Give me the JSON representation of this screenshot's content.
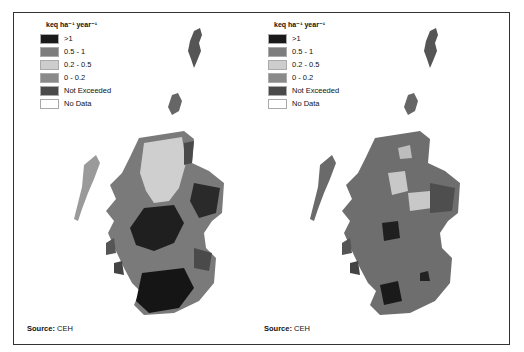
{
  "maps": [
    {
      "id": "left",
      "legend": {
        "title": "keq ha⁻¹ year⁻¹",
        "items": [
          {
            "label": ">1",
            "color": "#1a1a1a"
          },
          {
            "label": "0.5 - 1",
            "color": "#7d7d7d"
          },
          {
            "label": "0.2 - 0.5",
            "color": "#cdcdcd"
          },
          {
            "label": "0 - 0.2",
            "color": "#8a8a8a"
          },
          {
            "label": "Not Exceeded",
            "color": "#4a4a4a"
          },
          {
            "label": "No Data",
            "color": "#ffffff"
          }
        ]
      },
      "source": {
        "label": "Source:",
        "value": " CEH"
      },
      "region": "Scotland"
    },
    {
      "id": "right",
      "legend": {
        "title": "keq ha⁻¹ year⁻¹",
        "items": [
          {
            "label": ">1",
            "color": "#1a1a1a"
          },
          {
            "label": "0.5 - 1",
            "color": "#7d7d7d"
          },
          {
            "label": "0.2 - 0.5",
            "color": "#cdcdcd"
          },
          {
            "label": "0 - 0.2",
            "color": "#8a8a8a"
          },
          {
            "label": "Not Exceeded",
            "color": "#4a4a4a"
          },
          {
            "label": "No Data",
            "color": "#ffffff"
          }
        ]
      },
      "source": {
        "label": "Source:",
        "value": " CEH"
      },
      "region": "Scotland"
    }
  ]
}
